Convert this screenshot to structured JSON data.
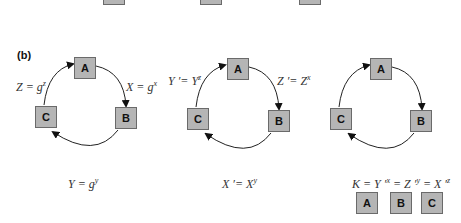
{
  "panel_tag": "(b)",
  "top_boxes": [
    "",
    "",
    ""
  ],
  "panels": [
    {
      "nodes": {
        "A": "A",
        "B": "B",
        "C": "C"
      },
      "arrow_labels": {
        "a_to_b": {
          "base": "X = g",
          "exp": "x"
        },
        "c_to_a": {
          "base": "Z = g",
          "exp": "z"
        }
      },
      "caption": {
        "base": "Y = g",
        "exp": "y"
      }
    },
    {
      "nodes": {
        "A": "A",
        "B": "B",
        "C": "C"
      },
      "arrow_labels": {
        "a_to_b": {
          "base": "Z ′= Z",
          "exp": "x"
        },
        "c_to_a": {
          "base": "Y ′= Y",
          "exp": "z"
        }
      },
      "caption": {
        "base": "X ′= X",
        "exp": "y"
      }
    },
    {
      "nodes": {
        "A": "A",
        "B": "B",
        "C": "C"
      },
      "caption": {
        "k": "K = Y ′",
        "e1": "x",
        "z": "= Z ′",
        "e2": "y",
        "x": "= X ′",
        "e3": "z"
      },
      "key_holders": [
        "A",
        "B",
        "C"
      ]
    }
  ]
}
